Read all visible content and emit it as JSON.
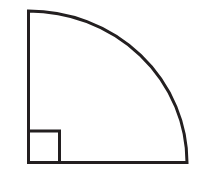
{
  "figure": {
    "canvas": {
      "width": 202,
      "height": 173,
      "background_color": "#ffffff"
    },
    "style": {
      "stroke_color": "#231f20",
      "stroke_width": 3,
      "fill_color": "none"
    },
    "shapes": [
      {
        "name": "quarter-circle-sector",
        "type": "sector",
        "center": {
          "x": 28.5,
          "y": 162.5
        },
        "radius_x": 158.5,
        "radius_y": 151.5,
        "start_angle_deg": 90,
        "sweep_deg": 90,
        "vertical_radius_endpoint": {
          "x": 28.5,
          "y": 11.0
        },
        "horizontal_radius_endpoint": {
          "x": 187.0,
          "y": 162.5
        },
        "path": "M 28.5 11 L 28.5 162.5 L 187 162.5 A 158.5 151.5 0 0 0 28.5 11 Z"
      },
      {
        "name": "right-angle-marker-square",
        "type": "rect",
        "x": 28.5,
        "y": 131.0,
        "width": 31.0,
        "height": 31.5,
        "path": "M 28.5 131 L 59.5 131 L 59.5 162.5 L 28.5 162.5"
      }
    ],
    "labels": [],
    "annotations": []
  }
}
